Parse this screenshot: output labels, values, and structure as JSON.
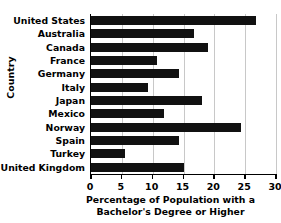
{
  "chart_data": {
    "type": "bar",
    "orientation": "horizontal",
    "title": "",
    "xlabel": "Percentage of Population with a Bachelor's Degree or Higher",
    "xlabel_line1": "Percentage of Population with a",
    "xlabel_line2": "Bachelor's Degree or Higher",
    "ylabel": "Country",
    "categories": [
      "United States",
      "Australia",
      "Canada",
      "France",
      "Germany",
      "Italy",
      "Japan",
      "Mexico",
      "Norway",
      "Spain",
      "Turkey",
      "United Kingdom"
    ],
    "values": [
      26.7,
      16.7,
      18.9,
      10.7,
      14.3,
      9.3,
      18.0,
      11.8,
      24.3,
      14.3,
      5.5,
      15.0
    ],
    "xlim": [
      0,
      30
    ],
    "xticks": [
      0,
      5,
      10,
      15,
      20,
      25,
      30
    ],
    "xticklabels": [
      "0",
      "5",
      "10",
      "15",
      "20",
      "25",
      "30"
    ],
    "grid": "vertical",
    "legend": "none",
    "bar_color": "#111111",
    "gridline_color": "#c8c8c8",
    "axis_color": "#000000"
  }
}
